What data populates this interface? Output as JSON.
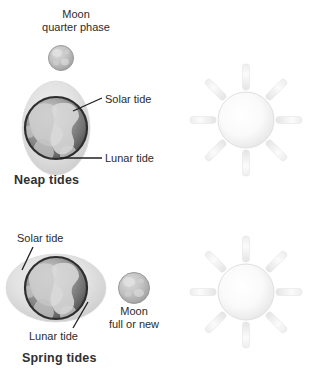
{
  "figure": {
    "background_color": "#ffffff"
  },
  "panels": [
    {
      "id": "neap",
      "caption": "Neap tides",
      "moon_label_line1": "Moon",
      "moon_label_line2": "quarter phase",
      "solar_tide_label": "Solar tide",
      "lunar_tide_label": "Lunar tide",
      "bulge_orientation": "vertical"
    },
    {
      "id": "spring",
      "caption": "Spring tides",
      "moon_label_line1": "Moon",
      "moon_label_line2": "full or new",
      "solar_tide_label": "Solar tide",
      "lunar_tide_label": "Lunar tide",
      "bulge_orientation": "horizontal"
    }
  ],
  "labels": {
    "moon_quarter_phase": "Moon\nquarter phase",
    "moon_quarter_phase_line1": "Moon",
    "moon_quarter_phase_line2": "quarter phase",
    "solar_tide_neap": "Solar tide",
    "lunar_tide_neap": "Lunar tide",
    "neap_tides": "Neap tides",
    "solar_tide_spring": "Solar tide",
    "lunar_tide_spring": "Lunar tide",
    "moon_full_or_new_line1": "Moon",
    "moon_full_or_new_line2": "full or new",
    "spring_tides": "Spring tides"
  },
  "objects": {
    "sun_top": {
      "name": "sun",
      "rays": 8,
      "center": [
        246,
        120
      ],
      "radius": 28
    },
    "sun_bottom": {
      "name": "sun",
      "rays": 8,
      "center": [
        246,
        292
      ],
      "radius": 28
    },
    "earth_neap": {
      "name": "earth",
      "center": [
        56,
        128
      ],
      "radius": 32
    },
    "earth_spring": {
      "name": "earth",
      "center": [
        56,
        288
      ],
      "radius": 32
    },
    "moon_quarter": {
      "name": "moon",
      "center": [
        61,
        58
      ],
      "radius": 13
    },
    "moon_full_new": {
      "name": "moon",
      "center": [
        134,
        288
      ],
      "radius": 16
    }
  },
  "colors": {
    "text": "#2b2b2b",
    "caption": "#303030",
    "leader_line": "#1f1f1f",
    "earth_dark": "#5b5b5b",
    "earth_light": "#c9c9c9",
    "moon_fill": "#bdbdbd",
    "sun_fill": "#f4f4f4",
    "bulge": "#e3e3e3",
    "background": "#ffffff"
  }
}
